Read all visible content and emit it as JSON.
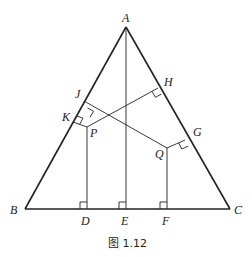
{
  "figure": {
    "caption": "图 1.12",
    "labels": {
      "A": "A",
      "B": "B",
      "C": "C",
      "D": "D",
      "E": "E",
      "F": "F",
      "G": "G",
      "H": "H",
      "J": "J",
      "K": "K",
      "P": "P",
      "Q": "Q"
    },
    "points": {
      "A": [
        126,
        27
      ],
      "B": [
        25,
        209
      ],
      "C": [
        230,
        209
      ],
      "D": [
        87,
        209
      ],
      "E": [
        126,
        209
      ],
      "F": [
        167,
        209
      ],
      "P": [
        87,
        127
      ],
      "Q": [
        167,
        148
      ],
      "H": [
        158,
        88
      ],
      "J": [
        84,
        101
      ],
      "K": [
        73,
        122
      ],
      "G": [
        185,
        140
      ]
    },
    "colors": {
      "stroke": "#222222",
      "background": "#ffffff"
    }
  }
}
